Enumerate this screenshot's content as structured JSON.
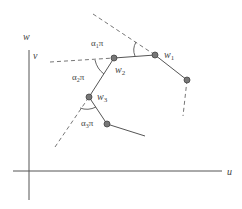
{
  "diagram": {
    "axes": {
      "vertical_label_top": "w",
      "vertical_label": "v",
      "horizontal_label": "u"
    },
    "nodes": [
      {
        "id": "w1",
        "label": "w",
        "sub": "1"
      },
      {
        "id": "w2",
        "label": "w",
        "sub": "2"
      },
      {
        "id": "w3",
        "label": "w",
        "sub": "3"
      },
      {
        "id": "n4"
      },
      {
        "id": "n0"
      }
    ],
    "angles": [
      {
        "label": "α",
        "sub": "1",
        "suffix": "π"
      },
      {
        "label": "α",
        "sub": "2",
        "suffix": "π"
      },
      {
        "label": "α",
        "sub": "3",
        "suffix": "π"
      }
    ],
    "colors": {
      "line": "#555555",
      "dashed": "#666666",
      "node_fill": "#777777",
      "node_stroke": "#444444",
      "axis": "#333333"
    }
  }
}
